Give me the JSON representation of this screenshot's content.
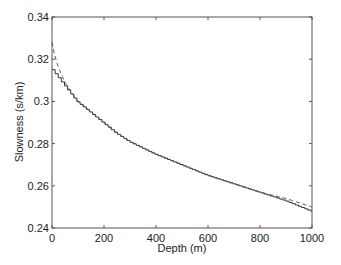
{
  "chart_data": {
    "type": "line",
    "title": "",
    "xlabel": "Depth (m)",
    "ylabel": "Slowness (s/km)",
    "xlim": [
      0,
      1000
    ],
    "ylim": [
      0.24,
      0.34
    ],
    "xticks": [
      0,
      200,
      400,
      600,
      800,
      1000
    ],
    "yticks": [
      0.24,
      0.26,
      0.28,
      0.3,
      0.32,
      0.34
    ],
    "xtick_labels": [
      "0",
      "200",
      "400",
      "600",
      "800",
      "1000"
    ],
    "ytick_labels": [
      "0.24",
      "0.26",
      "0.28",
      "0.3",
      "0.32",
      "0.34"
    ],
    "grid": false,
    "legend": null,
    "series": [
      {
        "name": "layered (staircase)",
        "style": "solid-step",
        "x": [
          0,
          25,
          50,
          75,
          100,
          150,
          200,
          250,
          300,
          400,
          500,
          600,
          700,
          800,
          900,
          1000
        ],
        "values": [
          0.316,
          0.312,
          0.308,
          0.304,
          0.3,
          0.295,
          0.29,
          0.285,
          0.281,
          0.275,
          0.27,
          0.265,
          0.261,
          0.257,
          0.253,
          0.248
        ]
      },
      {
        "name": "continuous",
        "style": "dashed",
        "x": [
          0,
          10,
          25,
          50,
          75,
          100,
          150,
          200,
          250,
          300,
          400,
          500,
          600,
          700,
          800,
          900,
          1000
        ],
        "values": [
          0.328,
          0.322,
          0.316,
          0.309,
          0.304,
          0.3,
          0.295,
          0.29,
          0.285,
          0.281,
          0.275,
          0.27,
          0.265,
          0.261,
          0.257,
          0.254,
          0.25
        ]
      }
    ]
  }
}
